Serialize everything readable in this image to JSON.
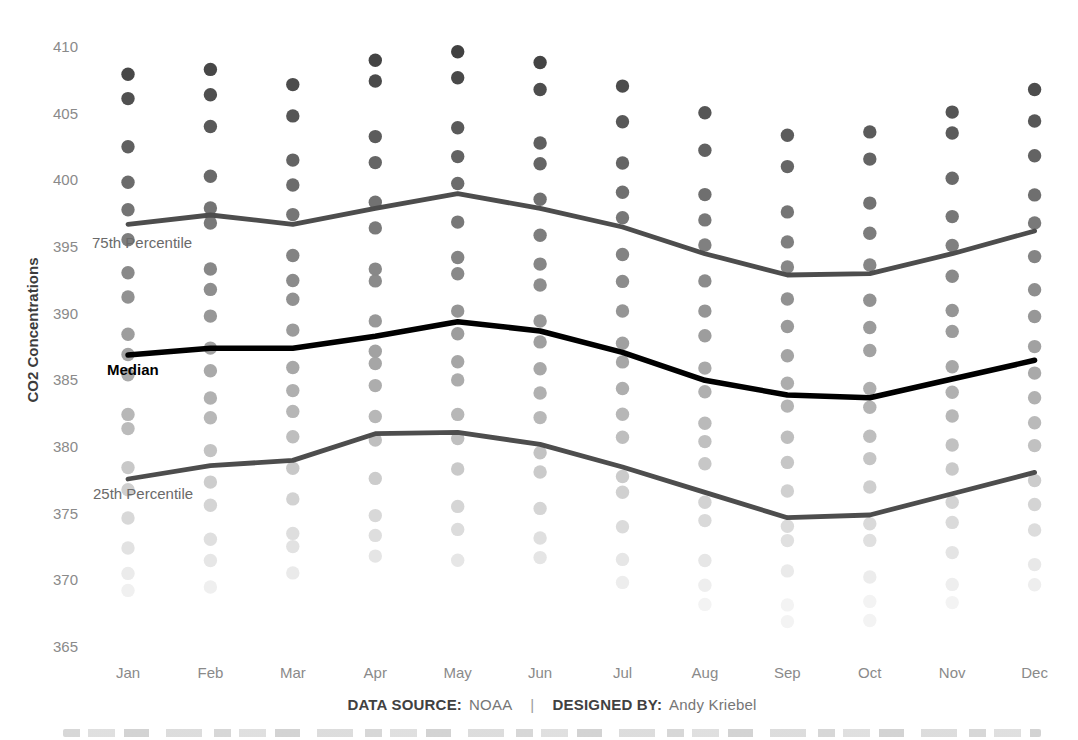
{
  "accent_colors": {
    "dot_high": "#454545",
    "dot_low": "#f2f2f2",
    "percentile_line": "#4d4d4d",
    "median_line": "#000000",
    "tick_label": "#8a8a8a",
    "axis_title": "#3c3c3c",
    "annotation_gray": "#6a6a6a"
  },
  "footer": {
    "source_label": "DATA SOURCE:",
    "source_value": "NOAA",
    "separator": "|",
    "designed_label": "DESIGNED BY:",
    "designed_value": "Andy Kriebel"
  },
  "chart_data": {
    "type": "scatter",
    "title": "",
    "xlabel": "",
    "ylabel": "CO2 Concentrations",
    "unit": "ppm CO2",
    "grid": false,
    "legend_position": "none (inline line annotations at left)",
    "categories": [
      "Jan",
      "Feb",
      "Mar",
      "Apr",
      "May",
      "Jun",
      "Jul",
      "Aug",
      "Sep",
      "Oct",
      "Nov",
      "Dec"
    ],
    "y_ticks": [
      365,
      370,
      375,
      380,
      385,
      390,
      395,
      400,
      405,
      410
    ],
    "ylim": [
      365,
      410
    ],
    "dot_color_scale": "grayscale by value: dark near 410, fades to near-white near 366",
    "years": [
      2000,
      2001,
      2002,
      2003,
      2004,
      2005,
      2006,
      2007,
      2008,
      2009,
      2010,
      2011,
      2012,
      2013,
      2014,
      2015,
      2016,
      2017,
      2018
    ],
    "dots_by_year": {
      "2000": [
        369.25,
        369.5,
        370.56,
        371.82,
        371.51,
        371.71,
        369.85,
        368.2,
        366.91,
        366.99,
        368.33,
        369.67
      ],
      "2001": [
        370.52,
        371.49,
        372.53,
        373.37,
        373.82,
        373.18,
        371.57,
        369.63,
        368.16,
        368.42,
        369.7,
        371.18
      ],
      "2002": [
        372.43,
        373.09,
        373.52,
        374.86,
        375.55,
        375.4,
        374.02,
        371.49,
        370.71,
        370.25,
        372.08,
        373.78
      ],
      "2003": [
        374.68,
        375.63,
        376.11,
        377.65,
        378.35,
        378.13,
        376.61,
        374.48,
        372.98,
        373.0,
        374.35,
        375.69
      ],
      "2004": [
        376.79,
        377.37,
        378.41,
        380.52,
        380.63,
        379.57,
        377.79,
        375.86,
        374.06,
        374.24,
        375.86,
        377.48
      ],
      "2005": [
        378.46,
        379.73,
        380.77,
        382.29,
        382.45,
        382.21,
        380.74,
        378.74,
        376.7,
        377.0,
        378.35,
        380.11
      ],
      "2006": [
        381.38,
        382.19,
        382.67,
        384.61,
        385.03,
        384.05,
        382.46,
        380.41,
        378.85,
        379.13,
        380.15,
        381.82
      ],
      "2007": [
        382.45,
        383.68,
        384.23,
        386.26,
        386.39,
        385.87,
        384.39,
        381.78,
        380.73,
        380.81,
        382.33,
        383.69
      ],
      "2008": [
        385.42,
        385.72,
        385.96,
        387.18,
        388.5,
        387.88,
        386.38,
        384.15,
        383.07,
        382.98,
        384.11,
        385.54
      ],
      "2009": [
        386.94,
        387.42,
        388.77,
        389.46,
        390.19,
        389.45,
        387.78,
        385.92,
        384.79,
        384.39,
        386.02,
        387.53
      ],
      "2010": [
        388.45,
        389.82,
        391.08,
        392.46,
        393.0,
        392.15,
        390.2,
        388.35,
        386.85,
        387.24,
        388.67,
        389.79
      ],
      "2011": [
        391.25,
        391.82,
        392.49,
        393.34,
        394.21,
        393.72,
        392.42,
        390.19,
        389.04,
        388.96,
        390.24,
        391.8
      ],
      "2012": [
        393.07,
        393.35,
        394.36,
        396.43,
        396.87,
        395.88,
        394.44,
        392.46,
        391.1,
        391.01,
        392.81,
        394.28
      ],
      "2013": [
        395.55,
        396.8,
        397.43,
        398.35,
        399.76,
        398.58,
        397.2,
        395.15,
        393.51,
        393.66,
        395.11,
        396.81
      ],
      "2014": [
        397.8,
        397.93,
        399.65,
        401.33,
        401.78,
        401.25,
        399.1,
        397.03,
        395.38,
        396.03,
        397.28,
        398.91
      ],
      "2015": [
        399.85,
        400.31,
        401.52,
        403.28,
        403.94,
        402.8,
        401.3,
        398.93,
        397.63,
        398.29,
        400.16,
        401.85
      ],
      "2016": [
        402.52,
        404.04,
        404.83,
        407.45,
        407.7,
        406.81,
        404.39,
        402.25,
        401.03,
        401.59,
        403.55,
        404.45
      ],
      "2017": [
        406.13,
        406.42,
        407.18,
        409.01,
        409.65,
        408.84,
        407.07,
        405.07,
        403.38,
        403.63,
        405.12,
        406.81
      ],
      "2018": [
        407.96,
        408.32,
        null,
        null,
        null,
        null,
        null,
        null,
        null,
        null,
        null,
        null
      ]
    },
    "lines": [
      {
        "id": "p75",
        "label": "75th Percentile",
        "color": "#4d4d4d",
        "width": 4.8,
        "values": [
          396.7,
          397.4,
          396.7,
          397.9,
          399.0,
          397.9,
          396.5,
          394.5,
          392.9,
          393.0,
          394.5,
          396.2
        ]
      },
      {
        "id": "median",
        "label": "Median",
        "color": "#000000",
        "width": 5.5,
        "values": [
          386.9,
          387.4,
          387.4,
          388.3,
          389.4,
          388.7,
          387.1,
          385.0,
          383.9,
          383.7,
          385.1,
          386.5
        ]
      },
      {
        "id": "p25",
        "label": "25th Percentile",
        "color": "#4d4d4d",
        "width": 4.8,
        "values": [
          377.6,
          378.6,
          379.0,
          381.0,
          381.1,
          380.2,
          378.5,
          376.6,
          374.7,
          374.9,
          376.5,
          378.1
        ]
      }
    ]
  }
}
